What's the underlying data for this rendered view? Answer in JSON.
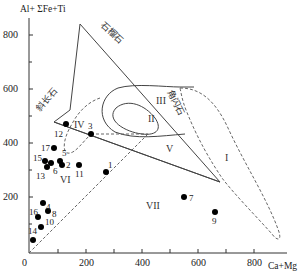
{
  "axes": {
    "y_title": "Al+ ΣFe+Ti",
    "x_title": "Ca+Mg",
    "x_ticks": [
      "0",
      "200",
      "400",
      "600",
      "800"
    ],
    "y_ticks": [
      "200",
      "400",
      "600",
      "800"
    ]
  },
  "minerals": {
    "garnet": "石榴石",
    "plagioclase": "斜长石",
    "hornblende": "角闪石"
  },
  "fields": {
    "I": "I",
    "II": "II",
    "III": "III",
    "IV": "IV",
    "V": "V",
    "VI": "VI",
    "VII": "VII"
  },
  "points": [
    {
      "label": "1",
      "x": 270,
      "y": 290
    },
    {
      "label": "2",
      "x": 115,
      "y": 318
    },
    {
      "label": "3",
      "x": 220,
      "y": 435
    },
    {
      "label": "4",
      "x": 55,
      "y": 175
    },
    {
      "label": "5",
      "x": 110,
      "y": 335
    },
    {
      "label": "6",
      "x": 80,
      "y": 325
    },
    {
      "label": "7",
      "x": 550,
      "y": 200
    },
    {
      "label": "8",
      "x": 68,
      "y": 222
    },
    {
      "label": "9",
      "x": 660,
      "y": 145
    },
    {
      "label": "10",
      "x": 45,
      "y": 90
    },
    {
      "label": "11",
      "x": 180,
      "y": 318
    },
    {
      "label": "12",
      "x": 130,
      "y": 460
    },
    {
      "label": "13",
      "x": 65,
      "y": 312
    },
    {
      "label": "14",
      "x": 15,
      "y": 50
    },
    {
      "label": "15",
      "x": 55,
      "y": 330
    },
    {
      "label": "16",
      "x": 30,
      "y": 135
    },
    {
      "label": "17",
      "x": 90,
      "y": 385
    }
  ]
}
